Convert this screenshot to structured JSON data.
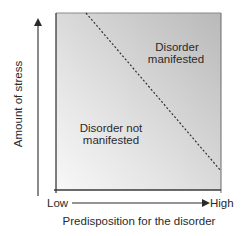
{
  "diagram": {
    "type": "diathesis-stress",
    "y_axis": {
      "label": "Amount of stress"
    },
    "x_axis": {
      "label": "Predisposition for the disorder",
      "low": "Low",
      "high": "High"
    },
    "regions": {
      "upper": {
        "line1": "Disorder",
        "line2": "manifested"
      },
      "lower": {
        "line1": "Disorder not",
        "line2": "manifested"
      }
    },
    "threshold_line": {
      "style": "dashed"
    },
    "colors": {
      "light": "#f7f7f7",
      "dark": "#b8b8b8",
      "frame": "#3a3a3a",
      "text": "#2a2a2a"
    }
  }
}
